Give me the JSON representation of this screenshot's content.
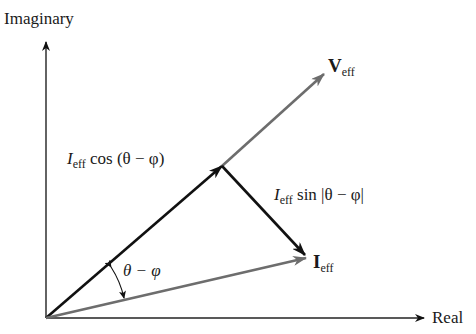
{
  "axes": {
    "y_label": "Imaginary",
    "x_label": "Real"
  },
  "vectors": {
    "voltage": {
      "symbol": "V",
      "subscript": "eff",
      "color": "#6d6d6d"
    },
    "current": {
      "symbol": "I",
      "subscript": "eff",
      "color": "#6d6d6d"
    }
  },
  "components": {
    "cos": {
      "symbol": "I",
      "subscript": "eff",
      "text": " cos (θ − φ)",
      "color": "#111111"
    },
    "sin": {
      "symbol": "I",
      "subscript": "eff",
      "text": " sin |θ − φ|",
      "color": "#111111"
    }
  },
  "angle": {
    "label": "θ − φ"
  },
  "colors": {
    "axis": "#222222",
    "black_vector": "#111111",
    "gray_vector": "#6d6d6d",
    "background": "#ffffff"
  }
}
